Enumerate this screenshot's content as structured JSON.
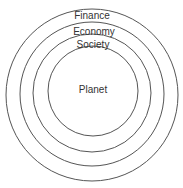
{
  "diagram": {
    "type": "nested-circles",
    "stroke_color": "#555555",
    "rings": [
      {
        "label": "Finance",
        "cx": 92,
        "cy": 95,
        "r": 86
      },
      {
        "label": "Economy",
        "cx": 92,
        "cy": 93,
        "r": 72
      },
      {
        "label": "Society",
        "cx": 92,
        "cy": 92,
        "r": 59
      },
      {
        "label": "Planet",
        "cx": 93,
        "cy": 90,
        "r": 45
      }
    ],
    "labels": {
      "finance": "Finance",
      "economy": "Economy",
      "society": "Society",
      "planet": "Planet"
    }
  }
}
